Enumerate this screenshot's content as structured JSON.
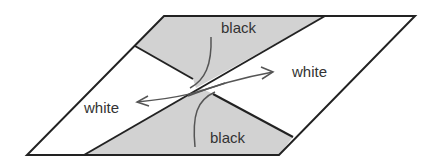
{
  "diagram": {
    "colors": {
      "background": "#ffffff",
      "shaded": "#d2d2d2",
      "stroke": "#222222",
      "arrow": "#555555",
      "text": "#333333"
    },
    "labels": {
      "top_region": "black",
      "bottom_region": "black",
      "left_region": "white",
      "right_region": "white"
    },
    "arrows": [
      {
        "from": "center",
        "to": "left_region_label",
        "direction": "left"
      },
      {
        "from": "center",
        "to": "right_region_label",
        "direction": "right"
      }
    ]
  }
}
